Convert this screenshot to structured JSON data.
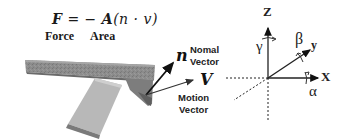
{
  "formula": {
    "text_F": "F",
    "text_eq": "= −",
    "text_A": "A",
    "text_paren": "(n · v)",
    "labels": {
      "force": "Force",
      "area": "Area"
    }
  },
  "vectors": {
    "normal": {
      "symbol": "n",
      "caption_line1": "Nomal",
      "caption_line2": "Vector"
    },
    "motion": {
      "symbol": "V",
      "caption_line1": "Motion",
      "caption_line2": "Vector"
    }
  },
  "axes": {
    "z": "Z",
    "y": "y",
    "x": "X",
    "gamma": "γ",
    "beta": "β",
    "alpha": "α"
  },
  "colors": {
    "bar_top": "#8a8a8a",
    "bar_side": "#6e6e6e",
    "plate": "#b5b5b5",
    "plate_edge": "#7a7a7a",
    "ink": "#111111"
  }
}
